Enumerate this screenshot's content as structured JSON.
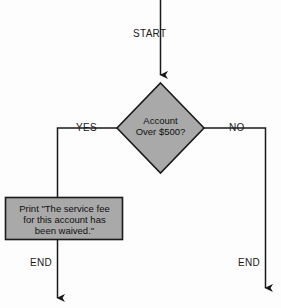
{
  "diagram": {
    "type": "flowchart",
    "colors": {
      "shape_fill": "#a9a9a9",
      "shape_stroke": "#1a1a1a",
      "connector": "#1a1a1a",
      "text": "#101010",
      "background": "#fdfdfd"
    },
    "nodes": {
      "start": {
        "kind": "terminator-label",
        "label": "START"
      },
      "decision": {
        "kind": "diamond",
        "line1": "Account",
        "line2": "Over $500?",
        "text": "Account\nOver $500?"
      },
      "process": {
        "kind": "rectangle",
        "line1": "Print \"The service fee",
        "line2": "for this account has",
        "line3": "been waived.\"",
        "text": "Print \"The service fee\nfor this account has\nbeen waived.\""
      },
      "end_yes": {
        "kind": "terminator-label",
        "label": "END"
      },
      "end_no": {
        "kind": "terminator-label",
        "label": "END"
      }
    },
    "edges": [
      {
        "from": "start",
        "to": "decision",
        "label": ""
      },
      {
        "from": "decision",
        "to": "process",
        "label": "YES"
      },
      {
        "from": "decision",
        "to": "end_no",
        "label": "NO"
      },
      {
        "from": "process",
        "to": "end_yes",
        "label": ""
      }
    ],
    "edge_labels": {
      "yes": "YES",
      "no": "NO"
    }
  }
}
